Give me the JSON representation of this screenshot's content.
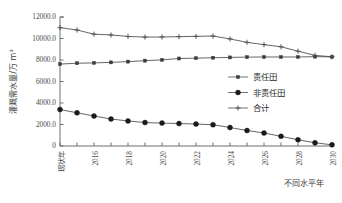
{
  "chart_data": {
    "type": "line",
    "title": "",
    "xlabel": "不同水平年",
    "ylabel": "灌溉需水量/万 m³",
    "grid": false,
    "legend_position": "center-right",
    "ylim": [
      0,
      12000
    ],
    "ytick_labels": [
      "0",
      "2000.0",
      "4000.0",
      "6000.0",
      "8000.0",
      "10000.0",
      "12000.0"
    ],
    "ytick_values": [
      0,
      2000,
      4000,
      6000,
      8000,
      10000,
      12000
    ],
    "categories": [
      "现状年",
      "",
      "2016",
      "",
      "2018",
      "",
      "2020",
      "",
      "2022",
      "",
      "2024",
      "",
      "2026",
      "",
      "2028",
      "",
      "2030"
    ],
    "x_tick_labels_shown": [
      "现状年",
      "2016",
      "2018",
      "2020",
      "2022",
      "2024",
      "2026",
      "2028",
      "2030"
    ],
    "series": [
      {
        "name": "责任田",
        "marker": "square",
        "values": [
          7620,
          7700,
          7730,
          7780,
          7850,
          7940,
          8010,
          8140,
          8170,
          8210,
          8240,
          8270,
          8280,
          8280,
          8280,
          8310,
          8290
        ]
      },
      {
        "name": "非责任田",
        "marker": "circle",
        "values": [
          3390,
          3090,
          2790,
          2510,
          2330,
          2180,
          2130,
          2090,
          2040,
          1980,
          1720,
          1440,
          1210,
          900,
          580,
          300,
          110
        ]
      },
      {
        "name": "合计",
        "marker": "plus",
        "values": [
          11010,
          10790,
          10400,
          10330,
          10190,
          10130,
          10140,
          10170,
          10200,
          10230,
          9960,
          9640,
          9430,
          9230,
          8820,
          8430,
          8300
        ]
      }
    ]
  },
  "legend": {
    "items": [
      {
        "label": "责任田"
      },
      {
        "label": "非责任田"
      },
      {
        "label": "合计"
      }
    ]
  },
  "colors": {
    "axis": "#6f6f6f",
    "series_line": "#4a4a4a",
    "text": "#3a3a3a",
    "background": "#ffffff"
  }
}
